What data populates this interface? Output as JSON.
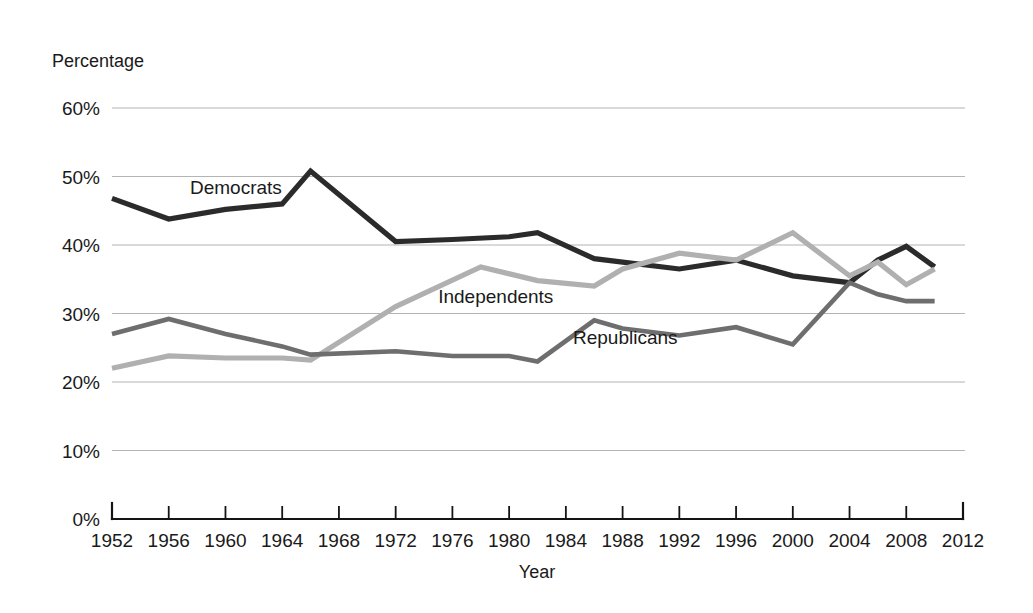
{
  "chart_data": {
    "type": "line",
    "title": "",
    "xlabel": "Year",
    "ylabel": "Percentage",
    "xlim": [
      1952,
      2012
    ],
    "ylim": [
      0,
      60
    ],
    "grid": true,
    "legend_position": "inline-labels",
    "y_ticks": [
      "0%",
      "10%",
      "20%",
      "30%",
      "40%",
      "50%",
      "60%"
    ],
    "y_tick_values": [
      0,
      10,
      20,
      30,
      40,
      50,
      60
    ],
    "x_ticks": [
      "1952",
      "1956",
      "1960",
      "1964",
      "1968",
      "1972",
      "1976",
      "1980",
      "1984",
      "1988",
      "1992",
      "1996",
      "2000",
      "2004",
      "2008",
      "2012"
    ],
    "x_tick_values": [
      1952,
      1956,
      1960,
      1964,
      1968,
      1972,
      1976,
      1980,
      1984,
      1988,
      1992,
      1996,
      2000,
      2004,
      2008,
      2012
    ],
    "series": [
      {
        "name": "Democrats",
        "color": "#2b2b2b",
        "label_x": 1957.5,
        "label_y": 47.5,
        "x": [
          1952,
          1956,
          1960,
          1964,
          1966,
          1972,
          1976,
          1980,
          1982,
          1986,
          1988,
          1992,
          1996,
          2000,
          2004,
          2006,
          2008,
          2010
        ],
        "values": [
          46.8,
          43.8,
          45.2,
          46.0,
          50.8,
          40.5,
          40.8,
          41.2,
          41.8,
          38.0,
          37.5,
          36.5,
          37.8,
          35.5,
          34.5,
          37.8,
          39.8,
          36.8
        ]
      },
      {
        "name": "Independents",
        "color": "#b0b0b0",
        "label_x": 1975.0,
        "label_y": 31.5,
        "x": [
          1952,
          1956,
          1960,
          1964,
          1966,
          1972,
          1978,
          1982,
          1986,
          1988,
          1992,
          1996,
          2000,
          2004,
          2006,
          2008,
          2010
        ],
        "values": [
          22.0,
          23.8,
          23.5,
          23.5,
          23.2,
          31.0,
          36.8,
          34.8,
          34.0,
          36.5,
          38.8,
          37.8,
          41.8,
          35.5,
          37.5,
          34.2,
          36.5
        ]
      },
      {
        "name": "Republicans",
        "color": "#6e6e6e",
        "label_x": 1984.5,
        "label_y": 25.5,
        "x": [
          1952,
          1956,
          1960,
          1964,
          1966,
          1972,
          1976,
          1980,
          1982,
          1986,
          1988,
          1992,
          1996,
          2000,
          2004,
          2006,
          2008,
          2010
        ],
        "values": [
          27.0,
          29.2,
          27.0,
          25.2,
          24.0,
          24.5,
          23.8,
          23.8,
          23.0,
          29.0,
          27.8,
          26.8,
          28.0,
          25.5,
          34.5,
          32.8,
          31.8,
          31.8
        ]
      }
    ]
  },
  "axes": {
    "y_axis_title": "Percentage",
    "x_axis_title": "Year"
  }
}
